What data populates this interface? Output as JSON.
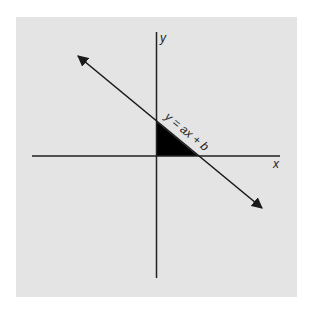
{
  "diagram": {
    "type": "coordinate-plane",
    "axes": {
      "x_label": "x",
      "y_label": "y"
    },
    "line": {
      "equation_label": "y = ax + b",
      "slope_sign": "negative",
      "arrows": "both-ends"
    },
    "shaded_region": {
      "shape": "right-triangle",
      "description": "triangle bounded by the line and the positive x and y axes",
      "fill": "#000000"
    },
    "colors": {
      "panel_background": "#e4e4e4",
      "page_background": "#ffffff",
      "stroke": "#222222"
    }
  }
}
